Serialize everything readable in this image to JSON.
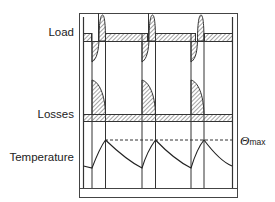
{
  "labels": {
    "load": "Load",
    "losses": "Losses",
    "temperature": "Temperature",
    "theta_symbol": "Θ",
    "theta_subscript": "max"
  },
  "diagram": {
    "cycles": 3,
    "colors": {
      "line": "#333333",
      "hatch": "#555555",
      "background": "#ffffff"
    }
  }
}
